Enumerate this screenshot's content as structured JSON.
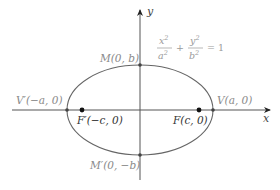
{
  "diagram": {
    "axes": {
      "x_label": "x",
      "y_label": "y"
    },
    "equation": {
      "term1_num": "x",
      "term1_den": "a",
      "term2_num": "y",
      "term2_den": "b",
      "exponent": "2",
      "plus": "+",
      "equals": "= 1"
    },
    "points": {
      "M": "M(0, b)",
      "M_prime": "M′(0, −b)",
      "V": "V(a, 0)",
      "V_prime": "V′(−a, 0)",
      "F": "F(c, 0)",
      "F_prime": "F′(−c, 0)"
    },
    "colors": {
      "curve": "#666666",
      "axis": "#555555",
      "focus_dot": "#111111",
      "label_gray": "#8a8a8a",
      "label_dark": "#333333"
    }
  }
}
